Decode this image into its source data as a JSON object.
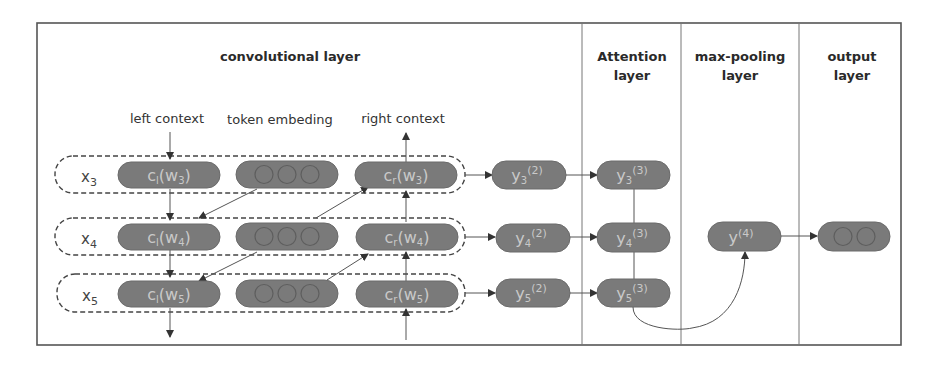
{
  "headers": {
    "conv": "convolutional layer",
    "attention": [
      "Attention",
      "layer"
    ],
    "maxpool": [
      "max-pooling",
      "layer"
    ],
    "output": [
      "output",
      "layer"
    ]
  },
  "labels": {
    "left_context": "left context",
    "token_embedding": "token embeding",
    "right_context": "right context"
  },
  "rows": [
    {
      "x": "x",
      "xsub": "3",
      "cl": "c",
      "cl_sub": "l",
      "cl_arg": "(w",
      "cl_argsub": "3",
      "cr": "c",
      "cr_sub": "r",
      "cr_argsub": "3",
      "y2": "y",
      "y2sub": "3",
      "y2sup": "(2)",
      "y3": "y",
      "y3sub": "3",
      "y3sup": "(3)"
    },
    {
      "x": "x",
      "xsub": "4",
      "cl": "c",
      "cl_sub": "l",
      "cl_arg": "(w",
      "cl_argsub": "4",
      "cr": "c",
      "cr_sub": "r",
      "cr_argsub": "4",
      "y2": "y",
      "y2sub": "4",
      "y2sup": "(2)",
      "y3": "y",
      "y3sub": "4",
      "y3sup": "(3)"
    },
    {
      "x": "x",
      "xsub": "5",
      "cl": "c",
      "cl_sub": "l",
      "cl_arg": "(w",
      "cl_argsub": "5",
      "cr": "c",
      "cr_sub": "r",
      "cr_argsub": "5",
      "y2": "y",
      "y2sub": "5",
      "y2sup": "(2)",
      "y3": "y",
      "y3sub": "5",
      "y3sup": "(3)"
    }
  ],
  "pooled": {
    "y": "y",
    "sup": "(4)"
  },
  "close_paren": ")"
}
